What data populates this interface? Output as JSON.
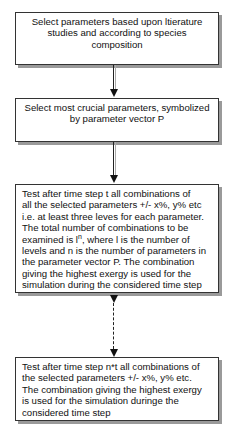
{
  "boxes": [
    {
      "lines": [
        "Select parameters based upon ltierature",
        "studies and according to species",
        "composition"
      ]
    },
    {
      "lines": [
        "Select most crucial parameters, symbolized",
        "by parameter vector P"
      ]
    },
    {
      "lines": [
        "Test after time step t  all combinations of",
        "all the selected parameters +/- x%, y% etc",
        "i.e. at least three leves for each parameter.",
        "The total number of combinations to be",
        "examined is l",
        "n",
        ", where l is the number of",
        "levels and n is the number of parameters in",
        "the parameter vector P. The combination",
        "giving the highest exergy is used for the",
        "simulation during the considered time step"
      ]
    },
    {
      "lines": [
        "Test after time step n*t all combinations of",
        "the selected parameters +/- x%, y% etc.",
        "The combination giving the highest exergy",
        "is used for the simulation duringe the",
        "considered time step"
      ]
    }
  ],
  "connectors": [
    {
      "from": 0,
      "to": 1,
      "style": "solid"
    },
    {
      "from": 1,
      "to": 2,
      "style": "solid"
    },
    {
      "from": 2,
      "to": 3,
      "style": "dashed"
    }
  ]
}
